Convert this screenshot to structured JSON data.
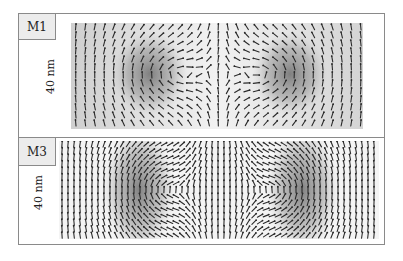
{
  "figure": {
    "panels": [
      {
        "label": "M1",
        "scale_label": "40 nm",
        "vortices": [
          {
            "cx_frac": 0.27,
            "cy_frac": 0.48,
            "rx_frac": 0.08,
            "ry_frac": 0.28
          },
          {
            "cx_frac": 0.75,
            "cy_frac": 0.48,
            "rx_frac": 0.08,
            "ry_frac": 0.28
          }
        ],
        "background_gradient": true
      },
      {
        "label": "M3",
        "scale_label": "40 nm",
        "vortices": [
          {
            "cx_frac": 0.25,
            "cy_frac": 0.5,
            "rx_frac": 0.07,
            "ry_frac": 0.46
          },
          {
            "cx_frac": 0.76,
            "cy_frac": 0.5,
            "rx_frac": 0.07,
            "ry_frac": 0.46
          }
        ],
        "background_gradient": false
      }
    ],
    "colors": {
      "frame": "#8a8a8a",
      "tag_bg": "#ececec",
      "arrow": "#2a2a2a",
      "vortex_core": "#6e6e6e"
    }
  }
}
